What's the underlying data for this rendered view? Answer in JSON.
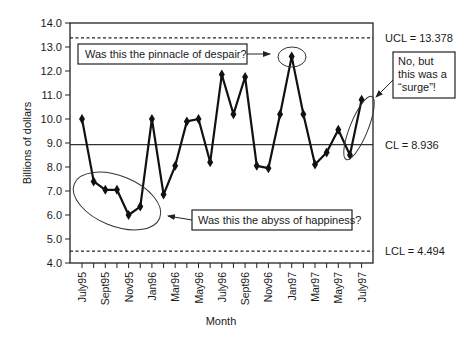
{
  "chart_data": {
    "type": "line",
    "title": "",
    "xlabel": "Month",
    "ylabel": "Billions of dollars",
    "ylim": [
      4.0,
      14.0
    ],
    "yticks": [
      "4.0",
      "5.0",
      "6.0",
      "7.0",
      "8.0",
      "9.0",
      "10.0",
      "11.0",
      "12.0",
      "13.0",
      "14.0"
    ],
    "xtick_labels": [
      "July95",
      "Sept95",
      "Nov95",
      "Jan96",
      "Mar96",
      "May96",
      "July96",
      "Sept96",
      "Nov96",
      "Jan97",
      "Mar97",
      "May97",
      "July97"
    ],
    "categories": [
      "July95",
      "Aug95",
      "Sept95",
      "Oct95",
      "Nov95",
      "Dec95",
      "Jan96",
      "Feb96",
      "Mar96",
      "Apr96",
      "May96",
      "June96",
      "July96",
      "Aug96",
      "Sept96",
      "Oct96",
      "Nov96",
      "Dec96",
      "Jan97",
      "Feb97",
      "Mar97",
      "Apr97",
      "May97",
      "June97",
      "July97"
    ],
    "series": [
      {
        "name": "Monthly value",
        "values": [
          10.0,
          7.4,
          7.05,
          7.05,
          6.0,
          6.35,
          10.0,
          6.85,
          8.05,
          9.9,
          10.0,
          8.2,
          11.85,
          10.2,
          11.75,
          8.05,
          7.95,
          10.2,
          12.6,
          10.2,
          8.1,
          8.6,
          9.55,
          8.5,
          10.8
        ]
      }
    ],
    "control_limits": {
      "UCL": 13.378,
      "CL": 8.936,
      "LCL": 4.494
    },
    "limit_labels": {
      "UCL": "UCL = 13.378",
      "CL": "CL = 8.936",
      "LCL": "LCL = 4.494"
    },
    "annotations": {
      "pinnacle": "Was this the pinnacle of despair?",
      "abyss": "Was this the abyss of happiness?",
      "surge_lines": [
        "No, but",
        "this was a",
        "“surge”!"
      ]
    },
    "grid": false,
    "legend": "none"
  }
}
